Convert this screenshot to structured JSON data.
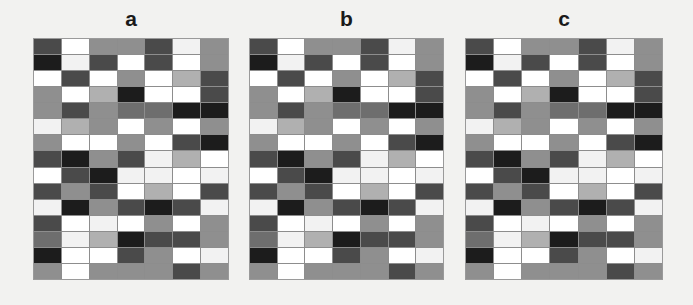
{
  "figure": {
    "background_color": "#f2f2f0",
    "panel_count": 3
  },
  "panels": [
    {
      "label": "a",
      "left": 34,
      "top": 8,
      "grid_left": 34,
      "grid_top": 43,
      "grid_width": 194,
      "grid_height": 240
    },
    {
      "label": "b",
      "left": 250,
      "top": 8,
      "grid_left": 250,
      "grid_top": 43,
      "grid_width": 193,
      "grid_height": 240
    },
    {
      "label": "c",
      "left": 466,
      "top": 8,
      "grid_left": 466,
      "grid_top": 43,
      "grid_width": 196,
      "grid_height": 240
    }
  ],
  "chart_data": {
    "type": "heatmap",
    "title": "",
    "xlabel": "",
    "ylabel": "",
    "rows": 15,
    "cols": 7,
    "colormap": "grayscale",
    "vmin": 0,
    "vmax": 1,
    "grid": true,
    "legend": "none",
    "gridline_color": "#8d8d8d",
    "panel_labels": [
      "a",
      "b",
      "c"
    ],
    "palette": {
      "0": "#1c1c1c",
      "1": "#4a4a4a",
      "2": "#6e6e6e",
      "3": "#8f8f8f",
      "4": "#b0b0b0",
      "5": "#d9d9d9",
      "6": "#f2f2f2",
      "7": "#ffffff"
    },
    "panels": [
      {
        "name": "a",
        "values": [
          [
            1,
            7,
            3,
            3,
            1,
            6,
            3
          ],
          [
            0,
            6,
            1,
            7,
            1,
            7,
            3
          ],
          [
            7,
            1,
            7,
            3,
            7,
            4,
            1
          ],
          [
            3,
            7,
            4,
            0,
            7,
            7,
            1
          ],
          [
            3,
            1,
            3,
            2,
            2,
            0,
            0
          ],
          [
            6,
            4,
            3,
            7,
            3,
            7,
            3
          ],
          [
            3,
            7,
            7,
            3,
            7,
            1,
            0
          ],
          [
            1,
            0,
            3,
            1,
            6,
            4,
            7
          ],
          [
            7,
            1,
            0,
            6,
            6,
            7,
            6
          ],
          [
            1,
            3,
            1,
            7,
            4,
            7,
            1
          ],
          [
            6,
            0,
            3,
            1,
            0,
            1,
            6
          ],
          [
            1,
            7,
            6,
            7,
            3,
            7,
            3
          ],
          [
            2,
            6,
            4,
            0,
            1,
            1,
            3
          ],
          [
            0,
            7,
            7,
            1,
            3,
            7,
            6
          ],
          [
            3,
            7,
            3,
            3,
            3,
            1,
            3
          ]
        ]
      },
      {
        "name": "b",
        "values": [
          [
            1,
            7,
            3,
            3,
            1,
            6,
            3
          ],
          [
            0,
            6,
            1,
            7,
            1,
            7,
            3
          ],
          [
            7,
            1,
            7,
            3,
            7,
            4,
            1
          ],
          [
            3,
            7,
            4,
            0,
            7,
            7,
            1
          ],
          [
            3,
            1,
            3,
            2,
            2,
            0,
            0
          ],
          [
            6,
            4,
            3,
            7,
            3,
            7,
            3
          ],
          [
            3,
            7,
            7,
            3,
            7,
            1,
            0
          ],
          [
            1,
            0,
            3,
            1,
            6,
            4,
            7
          ],
          [
            7,
            1,
            0,
            6,
            6,
            7,
            6
          ],
          [
            1,
            3,
            1,
            7,
            4,
            7,
            1
          ],
          [
            6,
            0,
            3,
            1,
            0,
            1,
            6
          ],
          [
            1,
            7,
            6,
            7,
            3,
            7,
            3
          ],
          [
            2,
            6,
            4,
            0,
            1,
            1,
            3
          ],
          [
            0,
            7,
            7,
            1,
            3,
            7,
            6
          ],
          [
            3,
            7,
            3,
            3,
            3,
            1,
            3
          ]
        ]
      },
      {
        "name": "c",
        "values": [
          [
            1,
            7,
            3,
            3,
            1,
            6,
            3
          ],
          [
            0,
            6,
            1,
            7,
            1,
            7,
            3
          ],
          [
            7,
            1,
            7,
            3,
            7,
            4,
            1
          ],
          [
            3,
            7,
            4,
            0,
            7,
            7,
            1
          ],
          [
            3,
            1,
            3,
            2,
            2,
            0,
            0
          ],
          [
            6,
            4,
            3,
            7,
            3,
            7,
            3
          ],
          [
            3,
            7,
            7,
            3,
            7,
            1,
            0
          ],
          [
            1,
            0,
            3,
            1,
            6,
            4,
            7
          ],
          [
            7,
            1,
            0,
            6,
            6,
            7,
            6
          ],
          [
            1,
            3,
            1,
            7,
            4,
            7,
            1
          ],
          [
            6,
            0,
            3,
            1,
            0,
            1,
            6
          ],
          [
            1,
            7,
            6,
            7,
            3,
            7,
            3
          ],
          [
            2,
            6,
            4,
            0,
            1,
            1,
            3
          ],
          [
            0,
            7,
            7,
            1,
            3,
            7,
            6
          ],
          [
            3,
            7,
            3,
            3,
            3,
            1,
            3
          ]
        ]
      }
    ]
  }
}
